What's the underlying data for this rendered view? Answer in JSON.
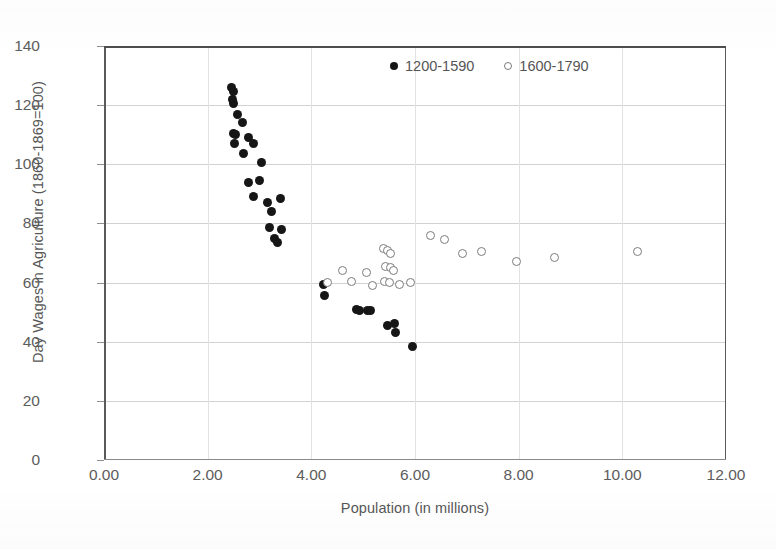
{
  "chart_data": {
    "type": "scatter",
    "title": "",
    "xlabel": "Population (in millions)",
    "ylabel": "Day Wages in Agriculture (1860-1869=100)",
    "xlim": [
      0,
      12
    ],
    "ylim": [
      0,
      140
    ],
    "xticks": [
      "0.00",
      "2.00",
      "4.00",
      "6.00",
      "8.00",
      "10.00",
      "12.00"
    ],
    "xtick_values": [
      0,
      2,
      4,
      6,
      8,
      10,
      12
    ],
    "yticks": [
      "0",
      "20",
      "40",
      "60",
      "80",
      "100",
      "120",
      "140"
    ],
    "ytick_values": [
      0,
      20,
      40,
      60,
      80,
      100,
      120,
      140
    ],
    "grid": "horizontal-and-vertical",
    "legend_position": "top-right-inside",
    "marker_colors": {
      "filled": "#161616",
      "open_edge": "#7b7b7b",
      "open_fill": "#ffffff"
    },
    "axis_color": "#5a5a5a",
    "gridline_color": "#d2d2d2",
    "text_color": "#575757",
    "series": [
      {
        "name": "1200-1590",
        "marker": "filled-circle",
        "points": [
          [
            2.46,
            126.0
          ],
          [
            2.5,
            124.5
          ],
          [
            2.47,
            122.0
          ],
          [
            2.5,
            120.5
          ],
          [
            2.58,
            117.0
          ],
          [
            2.68,
            114.0
          ],
          [
            2.5,
            110.5
          ],
          [
            2.54,
            110.0
          ],
          [
            2.78,
            109.0
          ],
          [
            2.52,
            107.0
          ],
          [
            2.88,
            107.0
          ],
          [
            2.7,
            103.5
          ],
          [
            3.04,
            100.5
          ],
          [
            2.78,
            94.0
          ],
          [
            3.0,
            94.5
          ],
          [
            2.88,
            89.0
          ],
          [
            3.16,
            87.0
          ],
          [
            3.4,
            88.5
          ],
          [
            3.24,
            84.0
          ],
          [
            3.2,
            78.5
          ],
          [
            3.42,
            78.0
          ],
          [
            3.28,
            75.0
          ],
          [
            3.34,
            73.5
          ],
          [
            4.24,
            59.5
          ],
          [
            4.26,
            55.5
          ],
          [
            4.88,
            51.0
          ],
          [
            4.92,
            50.5
          ],
          [
            5.08,
            50.5
          ],
          [
            5.14,
            50.5
          ],
          [
            5.46,
            45.5
          ],
          [
            5.6,
            46.0
          ],
          [
            5.62,
            43.0
          ],
          [
            5.96,
            38.5
          ]
        ]
      },
      {
        "name": "1600-1790",
        "marker": "open-circle",
        "points": [
          [
            4.32,
            60.0
          ],
          [
            4.6,
            64.0
          ],
          [
            4.78,
            60.5
          ],
          [
            5.06,
            63.5
          ],
          [
            5.18,
            59.0
          ],
          [
            5.4,
            71.5
          ],
          [
            5.46,
            71.0
          ],
          [
            5.52,
            70.0
          ],
          [
            5.44,
            65.5
          ],
          [
            5.52,
            65.0
          ],
          [
            5.58,
            64.0
          ],
          [
            5.42,
            60.5
          ],
          [
            5.5,
            60.0
          ],
          [
            5.7,
            59.5
          ],
          [
            5.92,
            60.0
          ],
          [
            6.3,
            76.0
          ],
          [
            6.56,
            74.5
          ],
          [
            6.92,
            70.0
          ],
          [
            7.28,
            70.5
          ],
          [
            7.96,
            67.0
          ],
          [
            8.7,
            68.5
          ],
          [
            10.3,
            70.5
          ]
        ]
      }
    ]
  },
  "legend": {
    "entries": [
      {
        "label": "1200-1590",
        "marker": "filled-circle"
      },
      {
        "label": "1600-1790",
        "marker": "open-circle"
      }
    ]
  }
}
